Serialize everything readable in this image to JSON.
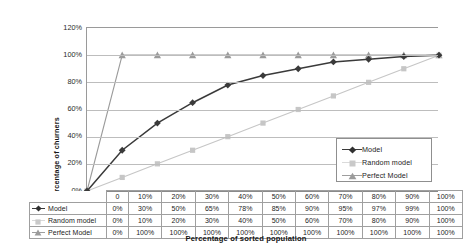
{
  "chart_data": {
    "type": "line",
    "title": "",
    "xlabel": "Percentage of sorted population",
    "ylabel": "Percentage of churners",
    "categories": [
      "0",
      "10%",
      "20%",
      "30%",
      "40%",
      "50%",
      "60%",
      "70%",
      "80%",
      "90%",
      "100%"
    ],
    "x": [
      0,
      10,
      20,
      30,
      40,
      50,
      60,
      70,
      80,
      90,
      100
    ],
    "xlim": [
      0,
      100
    ],
    "ylim": [
      0,
      120
    ],
    "yticks": [
      "0%",
      "20%",
      "40%",
      "60%",
      "80%",
      "100%",
      "120%"
    ],
    "ytick_values": [
      0,
      20,
      40,
      60,
      80,
      100,
      120
    ],
    "grid": true,
    "legend_position": "inside-bottom-right",
    "series": [
      {
        "name": "Model",
        "marker": "diamond",
        "color": "#3a3a3a",
        "values": [
          0,
          30,
          50,
          65,
          78,
          85,
          90,
          95,
          97,
          99,
          100
        ],
        "labels": [
          "0%",
          "30%",
          "50%",
          "65%",
          "78%",
          "85%",
          "90%",
          "95%",
          "97%",
          "99%",
          "100%"
        ]
      },
      {
        "name": "Random model",
        "marker": "square",
        "color": "#c6c6c6",
        "values": [
          0,
          10,
          20,
          30,
          40,
          50,
          60,
          70,
          80,
          90,
          100
        ],
        "labels": [
          "0%",
          "10%",
          "20%",
          "30%",
          "40%",
          "50%",
          "60%",
          "70%",
          "80%",
          "90%",
          "100%"
        ]
      },
      {
        "name": "Perfect Model",
        "marker": "triangle",
        "color": "#9b9b9b",
        "values": [
          0,
          100,
          100,
          100,
          100,
          100,
          100,
          100,
          100,
          100,
          100
        ],
        "labels": [
          "0%",
          "100%",
          "100%",
          "100%",
          "100%",
          "100%",
          "100%",
          "100%",
          "100%",
          "100%",
          "100%"
        ]
      }
    ]
  },
  "legend": {
    "items": [
      {
        "label": "Model"
      },
      {
        "label": "Random model"
      },
      {
        "label": "Perfect Model"
      }
    ]
  },
  "table": {
    "corner": "",
    "header": [
      "0",
      "10%",
      "20%",
      "30%",
      "40%",
      "50%",
      "60%",
      "70%",
      "80%",
      "90%",
      "100%"
    ],
    "rows": [
      {
        "label": "Model",
        "cells": [
          "0%",
          "30%",
          "50%",
          "65%",
          "78%",
          "85%",
          "90%",
          "95%",
          "97%",
          "99%",
          "100%"
        ]
      },
      {
        "label": "Random model",
        "cells": [
          "0%",
          "10%",
          "20%",
          "30%",
          "40%",
          "50%",
          "60%",
          "70%",
          "80%",
          "90%",
          "100%"
        ]
      },
      {
        "label": "Perfect Model",
        "cells": [
          "0%",
          "100%",
          "100%",
          "100%",
          "100%",
          "100%",
          "100%",
          "100%",
          "100%",
          "100%",
          "100%"
        ]
      }
    ]
  },
  "axes": {
    "y_title": "Percentage of churners",
    "x_title": "Percentage of sorted population"
  }
}
